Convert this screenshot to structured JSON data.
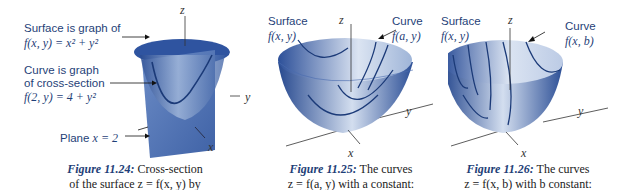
{
  "figures": [
    {
      "id": "11.24",
      "labels": {
        "surface_line1": "Surface is graph of",
        "surface_formula": "f(x, y) = x² + y²",
        "curve_line1": "Curve is graph",
        "curve_line2": "of cross-section",
        "curve_formula": "f(2, y) = 4 + y²",
        "plane_text": "Plane ",
        "plane_formula": "x = 2"
      },
      "axes": {
        "z": "z",
        "y": "y",
        "x": "x"
      },
      "caption": {
        "figure_number": "Figure 11.24:",
        "line1_text": " Cross-section",
        "line2_text": "of the surface z = f(x, y) by"
      }
    },
    {
      "id": "11.25",
      "labels": {
        "surface_label": "Surface",
        "surface_formula": "f(x, y)",
        "curve_label": "Curve",
        "curve_formula": "f(a, y)"
      },
      "axes": {
        "z": "z",
        "y": "y",
        "x": "x"
      },
      "caption": {
        "figure_number": "Figure 11.25:",
        "line1_text": " The curves",
        "line2_text": "z = f(a, y) with a constant:"
      }
    },
    {
      "id": "11.26",
      "labels": {
        "surface_label": "Surface",
        "surface_formula": "f(x, y)",
        "curve_label": "Curve",
        "curve_formula": "f(x, b)"
      },
      "axes": {
        "z": "z",
        "y": "y",
        "x": "x"
      },
      "caption": {
        "figure_number": "Figure 11.26:",
        "line1_text": " The curves",
        "line2_text": "z = f(x, b) with b constant:"
      }
    }
  ],
  "colors": {
    "surface_dark": "#27498f",
    "surface_light": "#c9d6ea",
    "label_blue": "#1f3f78",
    "plane": "#5c7fbd"
  }
}
